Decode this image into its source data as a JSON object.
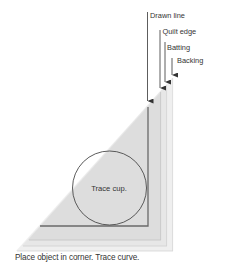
{
  "diagram": {
    "labels": {
      "drawn_line": "Drawn line",
      "quilt_edge": "Quilt edge",
      "batting": "Batting",
      "backing": "Backing",
      "circle": "Trace cup."
    },
    "caption": "Place object in corner. Trace curve.",
    "layers": [
      {
        "name": "Backing",
        "color": "#efefef"
      },
      {
        "name": "Batting",
        "color": "#e6e6e6"
      },
      {
        "name": "Quilt edge",
        "color": "#dcdcdc"
      },
      {
        "name": "Drawn line",
        "color": "#6a6a6a"
      }
    ],
    "colors": {
      "circle_stroke": "#4a4a4a",
      "arrow": "#333333",
      "text": "#333333"
    }
  }
}
